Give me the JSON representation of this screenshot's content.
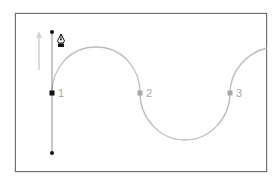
{
  "diagram": {
    "colors": {
      "frame": "#6f6f6f",
      "path": "#b8b8b8",
      "handle": "#8a8a8a",
      "selected_anchor": "#111111",
      "anchor": "#a8a8a8",
      "direction_arrow": "#cfcfcf",
      "label": "#a8a8a8"
    },
    "anchors": [
      {
        "label": "1",
        "x": 52,
        "y": 93,
        "selected": true
      },
      {
        "label": "2",
        "x": 140,
        "y": 93,
        "selected": false
      },
      {
        "label": "3",
        "x": 230,
        "y": 93,
        "selected": false
      }
    ],
    "handle": {
      "x": 52,
      "top_y": 32,
      "bottom_y": 153
    },
    "direction_arrow": {
      "x": 39,
      "from_y": 70,
      "to_y": 32,
      "direction": "up"
    },
    "tool_icon": "pen-tool-icon"
  }
}
